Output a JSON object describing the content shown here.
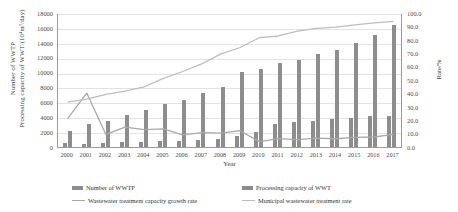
{
  "chart_data": {
    "type": "bar",
    "title": "",
    "xlabel": "Year",
    "ylabel_left_line1": "Number of WWTP",
    "ylabel_left_line2": "Processing capacity of WWT/(10⁴m³/day)",
    "ylabel_right": "Rate/%",
    "grid": true,
    "legend_position": "bottom",
    "categories": [
      "2000",
      "2001",
      "2002",
      "2003",
      "2004",
      "2005",
      "2006",
      "2007",
      "2008",
      "2009",
      "2010",
      "2011",
      "2012",
      "2013",
      "2014",
      "2015",
      "2016",
      "2017"
    ],
    "ylim_left": [
      0,
      18000
    ],
    "ytick_left": [
      "0",
      "2000",
      "4000",
      "6000",
      "8000",
      "10000",
      "12000",
      "14000",
      "16000",
      "18000"
    ],
    "ylim_right": [
      0,
      100
    ],
    "ytick_right": [
      "0.0",
      "10.0",
      "20.0",
      "30.0",
      "40.0",
      "50.0",
      "60.0",
      "70.0",
      "80.0",
      "90.0",
      "100.0"
    ],
    "series": [
      {
        "name": "Number of WWTP",
        "kind": "bar",
        "axis": "left",
        "color": "#8d8d8d",
        "values": [
          481,
          452,
          537,
          612,
          708,
          764,
          814,
          883,
          1122,
          1519,
          1993,
          3135,
          3340,
          3513,
          3717,
          3910,
          4119,
          4119
        ]
      },
      {
        "name": "Processing capacity of WWT",
        "kind": "bar",
        "axis": "left",
        "color": "#8d8d8d",
        "values": [
          2158,
          3106,
          3500,
          4255,
          4912,
          5725,
          6366,
          7210,
          8106,
          10065,
          10436,
          11303,
          11733,
          12454,
          13087,
          14038,
          15038,
          16444
        ]
      },
      {
        "name": "Wastewater treatment capacity growth rate",
        "kind": "line",
        "axis": "right",
        "color": "#a8a8a8",
        "values": [
          22.0,
          41.0,
          10.1,
          15.5,
          13.7,
          14.3,
          9.8,
          11.4,
          11.1,
          12.9,
          4.8,
          7.0,
          6.3,
          7.3,
          6.9,
          8.0,
          8.2,
          10.2
        ]
      },
      {
        "name": "Municipal wastewater treatment rate",
        "kind": "line",
        "axis": "right",
        "color": "#bdbdbd",
        "values": [
          34.3,
          36.4,
          40.0,
          42.4,
          45.7,
          52.0,
          57.1,
          62.8,
          70.2,
          75.0,
          82.3,
          83.6,
          87.3,
          89.3,
          90.2,
          91.9,
          93.4,
          94.5
        ]
      }
    ]
  },
  "legend": {
    "items": [
      {
        "label": "Number of WWTP",
        "swatch": "bar-swatch"
      },
      {
        "label": "Processing capacity of WWT",
        "swatch": "bar-swatch"
      },
      {
        "label": "Wastewater treatment capacity growth rate",
        "swatch": "line-swatch"
      },
      {
        "label": "Municipal wastewater treatment rate",
        "swatch": "line-swatch-light"
      }
    ]
  }
}
